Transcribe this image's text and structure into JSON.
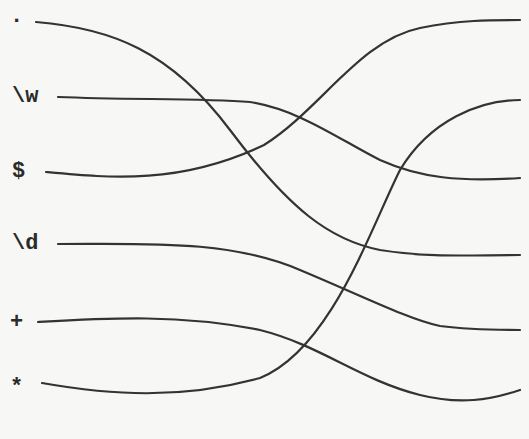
{
  "diagram": {
    "type": "crossing-lines-matching",
    "left_labels": [
      ".",
      "\\w",
      "$",
      "\\d",
      "+",
      "*"
    ],
    "connections": [
      {
        "from": ".",
        "to_right_index": 4
      },
      {
        "from": "\\w",
        "to_right_index": 3
      },
      {
        "from": "$",
        "to_right_index": 1
      },
      {
        "from": "\\d",
        "to_right_index": 5
      },
      {
        "from": "+",
        "to_right_index": 6
      },
      {
        "from": "*",
        "to_right_index": 2
      }
    ],
    "right_endpoint_count": 6,
    "line_color": "#333333"
  }
}
